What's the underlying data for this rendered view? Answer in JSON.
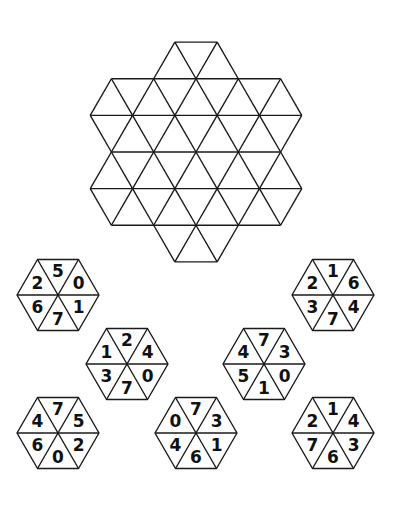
{
  "puzzle": {
    "grid": {
      "description": "Empty triangular grid formed by 7 hexagons (flower arrangement), 54 small triangles",
      "center": [
        196,
        152
      ],
      "side": 42.3,
      "line_color": "#1a1a1a"
    },
    "pieces_order_note": "values listed clockwise from top: [top, upper-right, lower-right, bottom, lower-left, upper-left]",
    "pieces": [
      {
        "id": "piece-1",
        "center": [
          58,
          295
        ],
        "values": [
          "5",
          "0",
          "1",
          "7",
          "6",
          "2"
        ]
      },
      {
        "id": "piece-2",
        "center": [
          333,
          295
        ],
        "values": [
          "1",
          "6",
          "4",
          "7",
          "3",
          "2"
        ]
      },
      {
        "id": "piece-3",
        "center": [
          127,
          364
        ],
        "values": [
          "2",
          "4",
          "0",
          "7",
          "3",
          "1"
        ]
      },
      {
        "id": "piece-4",
        "center": [
          264,
          364
        ],
        "values": [
          "7",
          "3",
          "0",
          "1",
          "5",
          "4"
        ]
      },
      {
        "id": "piece-5",
        "center": [
          58,
          433
        ],
        "values": [
          "7",
          "5",
          "2",
          "0",
          "6",
          "4"
        ]
      },
      {
        "id": "piece-6",
        "center": [
          196,
          433
        ],
        "values": [
          "7",
          "3",
          "1",
          "6",
          "4",
          "0"
        ]
      },
      {
        "id": "piece-7",
        "center": [
          333,
          433
        ],
        "values": [
          "1",
          "4",
          "3",
          "6",
          "7",
          "2"
        ]
      }
    ],
    "piece_radius": 41
  }
}
